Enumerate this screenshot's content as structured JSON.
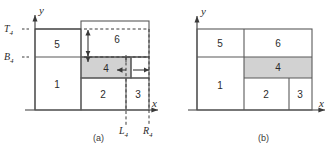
{
  "figure": {
    "panels": [
      {
        "id": "a",
        "caption": "(a)",
        "axes": {
          "x_label": "x",
          "y_label": "y"
        },
        "guide_labels": {
          "top": "T",
          "top_sub": "4",
          "bottom": "B",
          "bottom_sub": "4",
          "left": "L",
          "left_sub": "4",
          "right": "R",
          "right_sub": "4"
        },
        "regions": [
          {
            "label": "1",
            "shaded": false
          },
          {
            "label": "2",
            "shaded": false
          },
          {
            "label": "3",
            "shaded": false
          },
          {
            "label": "4",
            "shaded": true
          },
          {
            "label": "5",
            "shaded": false
          },
          {
            "label": "6",
            "shaded": false
          }
        ],
        "annotations": {
          "vertical_arrow_upper": "vertical-double-arrow",
          "vertical_arrow_lower": "vertical-tick-arrow",
          "horizontal_arrow_left": "left-arrow",
          "horizontal_arrow_right": "right-arrow"
        }
      },
      {
        "id": "b",
        "caption": "(b)",
        "axes": {
          "x_label": "x",
          "y_label": "y"
        },
        "regions": [
          {
            "label": "1",
            "shaded": false
          },
          {
            "label": "2",
            "shaded": false
          },
          {
            "label": "3",
            "shaded": false
          },
          {
            "label": "4",
            "shaded": true
          },
          {
            "label": "5",
            "shaded": false
          },
          {
            "label": "6",
            "shaded": false
          }
        ]
      }
    ],
    "colors": {
      "stroke": "#595959",
      "axis": "#3a3a3a",
      "shade_fill": "#d2d2d2",
      "text": "#2b2b2b",
      "background": "#ffffff"
    }
  }
}
